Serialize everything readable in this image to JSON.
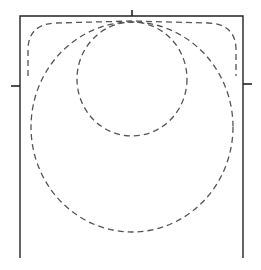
{
  "figure": {
    "frame": {
      "left": 20,
      "right": 243,
      "top": 16,
      "bottom": 258
    },
    "ticks": [
      {
        "name": "top-center-tick",
        "x1": 132,
        "y1": 10,
        "x2": 132,
        "y2": 16
      },
      {
        "name": "left-tick",
        "x1": 11,
        "y1": 86,
        "x2": 20,
        "y2": 86
      },
      {
        "name": "right-tick",
        "x1": 243,
        "y1": 84,
        "x2": 252,
        "y2": 84
      }
    ],
    "curves": [
      {
        "name": "small-circle",
        "cx": 132,
        "cy": 79,
        "rx": 55,
        "ry": 57
      },
      {
        "name": "large-circle",
        "cx": 132,
        "cy": 127,
        "rx": 101,
        "ry": 103
      },
      {
        "name": "rounded-boundary",
        "left": 28,
        "right": 236,
        "top": 22,
        "bottom": 76,
        "corner_radius": 26
      }
    ],
    "caption_partial": ""
  }
}
